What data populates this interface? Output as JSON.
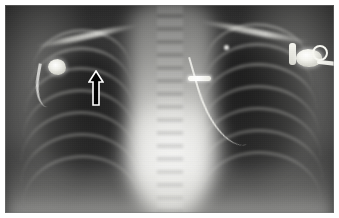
{
  "figure": {
    "kind": "medical-radiograph",
    "modality": "X-ray",
    "view": "chest-frontal-AP",
    "title": "",
    "caption": "",
    "border_color": "#ffffff",
    "film_background": "#343434"
  },
  "anatomy": {
    "mediastinum_label": "mediastinum",
    "heart_label": "cardiac silhouette",
    "left_lung_label": "right lung field",
    "right_lung_label": "left lung field",
    "spine_label": "thoracic spine",
    "diaphragm_label": "diaphragm",
    "clavicle_label": "clavicle",
    "rib_label": "rib"
  },
  "annotations": {
    "arrow": {
      "name": "black-up-arrow",
      "direction": "up",
      "fill_color": "#000000",
      "outline_color": "#ffffff",
      "x": 83,
      "y": 65,
      "width": 16,
      "height": 36
    }
  },
  "hardware": [
    {
      "name": "surgical-clip-marker",
      "label": "radiopaque linear marker",
      "color": "#ffffff"
    },
    {
      "name": "central-venous-catheter",
      "label": "catheter line",
      "color": "#fafaf5"
    },
    {
      "name": "left-metallic-device",
      "label": "metallic device",
      "color": "#f0f0ea"
    },
    {
      "name": "ecg-electrode-connector",
      "label": "ECG electrode connector",
      "color": "#f4f4ee"
    }
  ],
  "ribs": {
    "left": [
      {
        "left": 28,
        "top": 24,
        "width": 98,
        "height": 40
      },
      {
        "left": 24,
        "top": 42,
        "width": 104,
        "height": 44
      },
      {
        "left": 20,
        "top": 62,
        "width": 110,
        "height": 46
      },
      {
        "left": 18,
        "top": 84,
        "width": 114,
        "height": 48
      },
      {
        "left": 16,
        "top": 106,
        "width": 118,
        "height": 50
      },
      {
        "left": 16,
        "top": 128,
        "width": 120,
        "height": 50
      },
      {
        "left": 18,
        "top": 150,
        "width": 118,
        "height": 48
      }
    ],
    "right": [
      {
        "left": 200,
        "top": 18,
        "width": 104,
        "height": 40
      },
      {
        "left": 198,
        "top": 38,
        "width": 110,
        "height": 44
      },
      {
        "left": 196,
        "top": 58,
        "width": 116,
        "height": 46
      },
      {
        "left": 194,
        "top": 80,
        "width": 120,
        "height": 48
      },
      {
        "left": 192,
        "top": 102,
        "width": 124,
        "height": 50
      },
      {
        "left": 192,
        "top": 124,
        "width": 126,
        "height": 50
      },
      {
        "left": 194,
        "top": 146,
        "width": 122,
        "height": 48
      }
    ]
  },
  "clavicles": [
    {
      "left": 30,
      "top": 28,
      "width": 104,
      "rotate": -12
    },
    {
      "left": 194,
      "top": 24,
      "width": 112,
      "rotate": 11
    }
  ]
}
